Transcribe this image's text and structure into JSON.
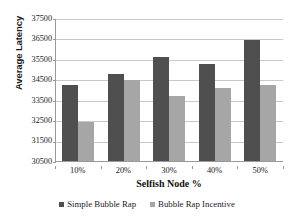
{
  "chart_data": {
    "type": "bar",
    "title": "",
    "xlabel": "Selfish Node %",
    "ylabel": "Average Latency",
    "categories": [
      "10%",
      "20%",
      "30%",
      "40%",
      "50%"
    ],
    "series": [
      {
        "name": "Simple Bubble Rap",
        "color": "#4f4f4f",
        "values": [
          34200,
          34750,
          35600,
          35250,
          36400
        ]
      },
      {
        "name": "Bubble Rap Incentive",
        "color": "#a6a6a6",
        "values": [
          32400,
          34450,
          33700,
          34050,
          34200
        ]
      }
    ],
    "ylim": [
      30500,
      37500
    ],
    "yticks": [
      30500,
      31500,
      32500,
      33500,
      34500,
      35500,
      36500,
      37500
    ],
    "ytick_labels": [
      "30500",
      "31500",
      "32500",
      "33500",
      "34500",
      "35500",
      "36500",
      "37500"
    ],
    "grid": true,
    "legend_position": "bottom"
  },
  "axes": {
    "y_title": "Average Latency",
    "x_title": "Selfish Node %"
  },
  "legend": {
    "items": [
      {
        "label": "Simple Bubble Rap",
        "swatch": "legend-swatch-dark"
      },
      {
        "label": "Bubble Rap Incentive",
        "swatch": "legend-swatch-light"
      }
    ]
  }
}
